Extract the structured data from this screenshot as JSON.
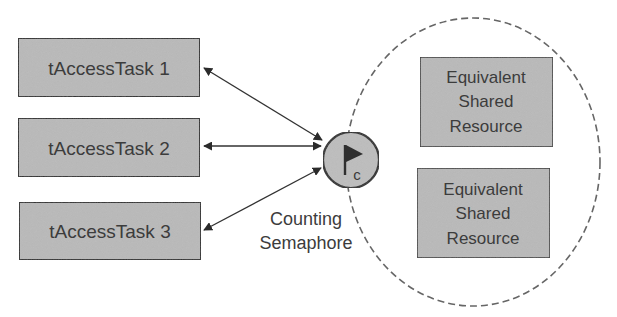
{
  "diagram": {
    "type": "semaphore-resource-diagram",
    "tasks": [
      {
        "label": "tAccessTask 1"
      },
      {
        "label": "tAccessTask 2"
      },
      {
        "label": "tAccessTask 3"
      }
    ],
    "semaphore": {
      "icon": "flag-icon",
      "badge": "c",
      "label_line1": "Counting",
      "label_line2": "Semaphore"
    },
    "resources": [
      {
        "line1": "Equivalent",
        "line2": "Shared",
        "line3": "Resource"
      },
      {
        "line1": "Equivalent",
        "line2": "Shared",
        "line3": "Resource"
      }
    ],
    "connections": [
      {
        "from": "tAccessTask 1",
        "to": "Counting Semaphore",
        "direction": "bidirectional"
      },
      {
        "from": "tAccessTask 2",
        "to": "Counting Semaphore",
        "direction": "bidirectional"
      },
      {
        "from": "tAccessTask 3",
        "to": "Counting Semaphore",
        "direction": "bidirectional"
      }
    ],
    "colors": {
      "box_fill": "#b9b9b9",
      "box_stroke": "#2e2e2e",
      "text": "#3c3c3c",
      "line": "#333333",
      "dashed_boundary": "#666666"
    }
  }
}
